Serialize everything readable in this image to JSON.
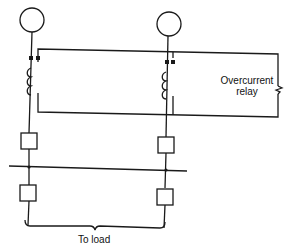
{
  "diagram": {
    "type": "circuit-schematic",
    "relay_label_line1": "Overcurrent",
    "relay_label_line2": "relay",
    "load_label": "To load",
    "colors": {
      "line": "#1a1a1a",
      "background": "#ffffff"
    },
    "components": {
      "generators": 2,
      "current_transformers": 2,
      "breakers_upper": 2,
      "breakers_lower": 2,
      "bus": 1,
      "relay": 1
    }
  }
}
